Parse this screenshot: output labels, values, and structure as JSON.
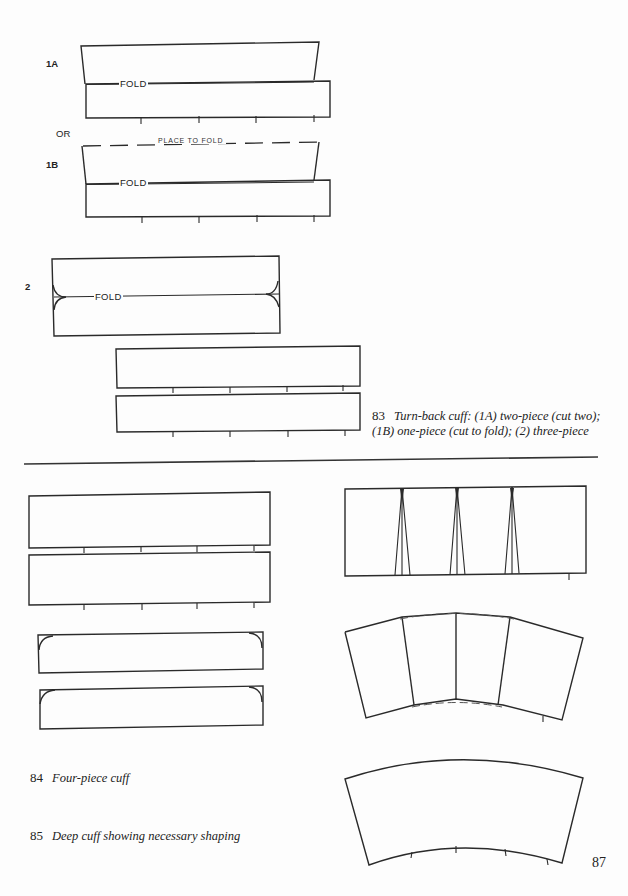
{
  "page": {
    "page_number": "87",
    "ink_color": "#2a2a2a",
    "paper_color": "#fdfdfd"
  },
  "figure_83": {
    "labels": {
      "one_a": "1A",
      "or": "OR",
      "one_b": "1B",
      "two": "2"
    },
    "fold_label": "FOLD",
    "place_to_fold_label": "PLACE  TO  FOLD",
    "caption": {
      "number": "83",
      "line1": "Turn-back cuff: (1A) two-piece (cut two);",
      "line2": "(1B) one-piece (cut to fold); (2) three-piece"
    }
  },
  "figure_84": {
    "caption": {
      "number": "84",
      "text": "Four-piece cuff"
    }
  },
  "figure_85": {
    "caption": {
      "number": "85",
      "text": "Deep cuff showing necessary shaping"
    }
  }
}
